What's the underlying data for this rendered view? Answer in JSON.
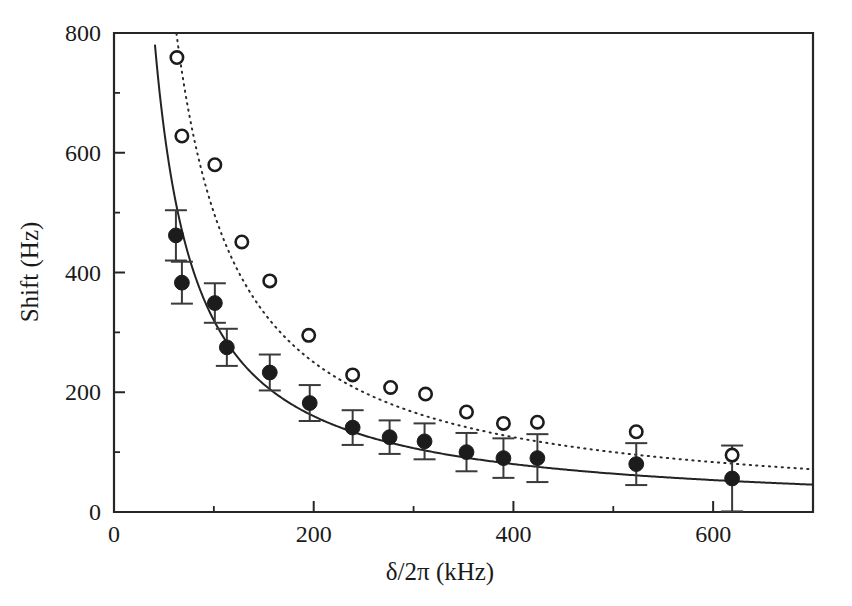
{
  "chart_data": {
    "type": "scatter",
    "title": "",
    "xlabel": "δ/2π (kHz)",
    "ylabel": "Shift (Hz)",
    "xlim": [
      0,
      700
    ],
    "ylim": [
      0,
      800
    ],
    "x_ticks_major": [
      0,
      200,
      400,
      600
    ],
    "x_ticks_minor": [
      100,
      300,
      500,
      700
    ],
    "x_tick_labels": [
      "0",
      "200",
      "400",
      "600"
    ],
    "y_ticks_major": [
      0,
      200,
      400,
      600,
      800
    ],
    "y_ticks_minor": [
      100,
      300,
      500,
      700
    ],
    "y_tick_labels": [
      "0",
      "200",
      "400",
      "600",
      "800"
    ],
    "grid": false,
    "legend": "none",
    "series": [
      {
        "name": "filled-circles",
        "marker": "filled-circle",
        "has_error_bars": true,
        "points": [
          {
            "x": 62,
            "y": 462,
            "yerr": 42
          },
          {
            "x": 68,
            "y": 383,
            "yerr": 35
          },
          {
            "x": 101,
            "y": 349,
            "yerr": 33
          },
          {
            "x": 113,
            "y": 275,
            "yerr": 31
          },
          {
            "x": 156,
            "y": 233,
            "yerr": 30
          },
          {
            "x": 196,
            "y": 182,
            "yerr": 30
          },
          {
            "x": 239,
            "y": 141,
            "yerr": 29
          },
          {
            "x": 276,
            "y": 125,
            "yerr": 28
          },
          {
            "x": 311,
            "y": 118,
            "yerr": 30
          },
          {
            "x": 353,
            "y": 100,
            "yerr": 32
          },
          {
            "x": 390,
            "y": 90,
            "yerr": 33
          },
          {
            "x": 424,
            "y": 90,
            "yerr": 40
          },
          {
            "x": 523,
            "y": 80,
            "yerr": 35
          },
          {
            "x": 619,
            "y": 56,
            "yerr": 55
          }
        ]
      },
      {
        "name": "open-circles",
        "marker": "open-circle",
        "has_error_bars": false,
        "points": [
          {
            "x": 63,
            "y": 759
          },
          {
            "x": 68,
            "y": 628
          },
          {
            "x": 101,
            "y": 580
          },
          {
            "x": 128,
            "y": 451
          },
          {
            "x": 156,
            "y": 386
          },
          {
            "x": 195,
            "y": 295
          },
          {
            "x": 239,
            "y": 229
          },
          {
            "x": 277,
            "y": 208
          },
          {
            "x": 312,
            "y": 197
          },
          {
            "x": 353,
            "y": 167
          },
          {
            "x": 390,
            "y": 148
          },
          {
            "x": 424,
            "y": 150
          },
          {
            "x": 523,
            "y": 134
          },
          {
            "x": 619,
            "y": 95
          }
        ]
      }
    ],
    "fit_curves": [
      {
        "name": "solid-fit",
        "style": "solid",
        "for_series": "filled-circles",
        "model": "A/x",
        "A": 32000,
        "x_start": 41,
        "x_end": 700,
        "y_at_x_start": 737,
        "y_at_x_end": 51
      },
      {
        "name": "dotted-fit",
        "style": "dotted",
        "for_series": "open-circles",
        "model": "B/x",
        "B": 50000,
        "x_start": 58,
        "x_end": 700,
        "y_at_x_start": 790,
        "y_at_x_end": 89
      }
    ]
  },
  "figure": {
    "background_color": "#ffffff",
    "axis_color": "#262626",
    "marker_color": "#1c1c1c"
  }
}
